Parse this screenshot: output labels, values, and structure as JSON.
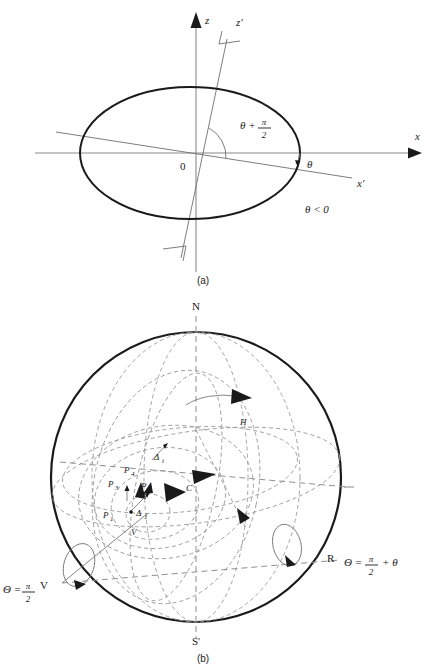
{
  "figure": {
    "title_a_caption": "(a)",
    "title_b_caption": "(b)"
  },
  "panel_a": {
    "name": "rotated-coordinate-axes-diagram",
    "axis_labels": {
      "z": "z",
      "z_prime": "z'",
      "x": "x",
      "x_prime": "x'",
      "origin": "0"
    },
    "angle_labels": {
      "theta_plus_half_pi_theta": "θ +",
      "theta_plus_half_pi_num": "π",
      "theta_plus_half_pi_den": "2",
      "theta": "θ"
    },
    "condition": "θ < 0"
  },
  "panel_b": {
    "name": "rotating-sphere-eigenmode-diagram",
    "pole_labels": {
      "north": "N",
      "south": "S'"
    },
    "point_labels": {
      "p1": "P",
      "p1_sub": "1",
      "p2": "P",
      "p2_sub": "2",
      "p3": "P",
      "p3_sub": "3",
      "p4": "P",
      "p4_sub": "4",
      "c": "C",
      "v_center": "V",
      "h": "H",
      "v_axis": "V",
      "r_axis": "R"
    },
    "delta_labels": {
      "delta_i": "Δ",
      "delta_i_sub": "i",
      "delta_1": "Δ",
      "delta_1_sub": "1"
    },
    "equations": {
      "theta_v_lhs": "Θ =",
      "theta_v_num": "π",
      "theta_v_den": "2",
      "theta_r_lhs": "Θ =",
      "theta_r_num": "π",
      "theta_r_den": "2",
      "theta_r_tail": "+ θ"
    }
  },
  "colors": {
    "ink": "#1a1a1a",
    "axis_gray": "#8a8a8a",
    "dash_gray": "#9a9a9a",
    "background": "#ffffff"
  }
}
